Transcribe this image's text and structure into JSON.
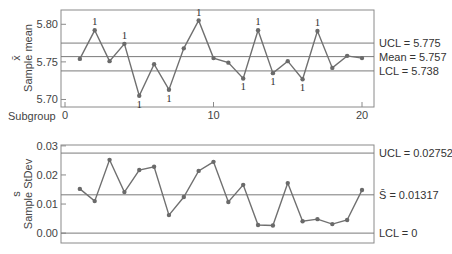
{
  "chart_data": [
    {
      "type": "line",
      "title": "Xbar chart",
      "xlabel": "Subgroup",
      "ylabel": "Sample mean",
      "ylabel_symbol": "x̄",
      "x": [
        1,
        2,
        3,
        4,
        5,
        6,
        7,
        8,
        9,
        10,
        11,
        12,
        13,
        14,
        15,
        16,
        17,
        18,
        19,
        20
      ],
      "values": [
        5.754,
        5.792,
        5.751,
        5.774,
        5.705,
        5.747,
        5.713,
        5.768,
        5.805,
        5.755,
        5.749,
        5.728,
        5.792,
        5.735,
        5.751,
        5.727,
        5.791,
        5.742,
        5.758,
        5.755
      ],
      "flags": [
        null,
        "1",
        null,
        "1",
        "1",
        null,
        "1",
        null,
        "1",
        null,
        null,
        "1",
        "1",
        "1",
        null,
        "1",
        "1",
        null,
        null,
        null
      ],
      "ylim": [
        5.69,
        5.819
      ],
      "yticks": [
        5.7,
        5.75,
        5.8
      ],
      "ytick_labels": [
        "5.70",
        "5.75",
        "5.80"
      ],
      "xticks": [
        0,
        10,
        20
      ],
      "xtick_labels": [
        "0",
        "10",
        "20"
      ],
      "reference_lines": [
        {
          "name": "UCL",
          "value": 5.775,
          "label": "UCL = 5.775"
        },
        {
          "name": "Mean",
          "value": 5.757,
          "label": "Mean = 5.757"
        },
        {
          "name": "LCL",
          "value": 5.738,
          "label": "LCL = 5.738"
        }
      ],
      "grid": false
    },
    {
      "type": "line",
      "title": "S chart",
      "xlabel": "",
      "ylabel": "Sample StDev",
      "ylabel_symbol": "s",
      "x": [
        1,
        2,
        3,
        4,
        5,
        6,
        7,
        8,
        9,
        10,
        11,
        12,
        13,
        14,
        15,
        16,
        17,
        18,
        19,
        20
      ],
      "values": [
        0.0152,
        0.011,
        0.0252,
        0.0141,
        0.0217,
        0.0228,
        0.0062,
        0.0124,
        0.0214,
        0.0245,
        0.0107,
        0.0166,
        0.0028,
        0.0026,
        0.0172,
        0.0041,
        0.0048,
        0.0031,
        0.0045,
        0.0148
      ],
      "ylim": [
        -0.0034,
        0.0303
      ],
      "yticks": [
        0.0,
        0.01,
        0.02,
        0.03
      ],
      "ytick_labels": [
        "0.00",
        "0.01",
        "0.02",
        "0.03"
      ],
      "reference_lines": [
        {
          "name": "UCL",
          "value": 0.02752,
          "label": "UCL = 0.02752"
        },
        {
          "name": "Sbar",
          "value": 0.01317,
          "label": "S̄ = 0.01317"
        },
        {
          "name": "LCL",
          "value": 0,
          "label": "LCL = 0"
        }
      ],
      "grid": false
    }
  ],
  "labels": {
    "top_ylabel": "Sample mean",
    "top_symbol": "x̄",
    "bottom_ylabel": "Sample StDev",
    "bottom_symbol": "s",
    "subgroup": "Subgroup"
  }
}
